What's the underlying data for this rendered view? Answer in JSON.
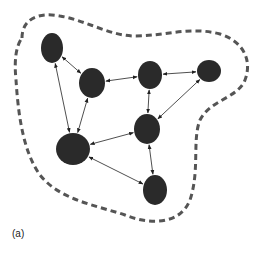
{
  "caption": "(a)",
  "colors": {
    "node": "#2a2a2a",
    "edge": "#222222",
    "boundary": "#555555",
    "background": "#ffffff"
  },
  "boundary": {
    "style": "dashed",
    "path": "M 22 38 C 22 18, 40 12, 60 16 C 85 20, 110 36, 135 36 C 165 36, 190 26, 220 34 C 245 42, 252 62, 245 80 C 238 98, 210 100, 200 120 C 192 140, 200 170, 190 200 C 180 225, 150 225, 125 215 C 95 205, 60 200, 40 175 C 22 150, 18 110, 16 80 C 14 60, 16 46, 22 38 Z"
  },
  "nodes": [
    {
      "id": "n1",
      "cx": 52,
      "cy": 48,
      "rx": 11,
      "ry": 15
    },
    {
      "id": "n2",
      "cx": 92,
      "cy": 83,
      "rx": 13,
      "ry": 15
    },
    {
      "id": "n3",
      "cx": 150,
      "cy": 75,
      "rx": 12,
      "ry": 14
    },
    {
      "id": "n4",
      "cx": 209,
      "cy": 71,
      "rx": 12,
      "ry": 11
    },
    {
      "id": "n5",
      "cx": 147,
      "cy": 129,
      "rx": 13,
      "ry": 15
    },
    {
      "id": "n6",
      "cx": 73,
      "cy": 149,
      "rx": 17,
      "ry": 16
    },
    {
      "id": "n7",
      "cx": 155,
      "cy": 190,
      "rx": 12,
      "ry": 15
    }
  ],
  "edges": [
    {
      "from": "n1",
      "to": "n2",
      "directed": "both"
    },
    {
      "from": "n1",
      "to": "n6",
      "directed": "both"
    },
    {
      "from": "n2",
      "to": "n6",
      "directed": "both"
    },
    {
      "from": "n2",
      "to": "n3",
      "directed": "both"
    },
    {
      "from": "n3",
      "to": "n4",
      "directed": "both"
    },
    {
      "from": "n3",
      "to": "n5",
      "directed": "both"
    },
    {
      "from": "n4",
      "to": "n5",
      "directed": "both"
    },
    {
      "from": "n5",
      "to": "n6",
      "directed": "both"
    },
    {
      "from": "n5",
      "to": "n7",
      "directed": "both"
    },
    {
      "from": "n6",
      "to": "n7",
      "directed": "both"
    }
  ]
}
